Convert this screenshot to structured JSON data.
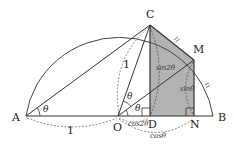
{
  "diagram": {
    "type": "semicircle-trig-geometry",
    "colors": {
      "stroke": "#333333",
      "shade": "#b0b0b0",
      "background": "#ffffff"
    },
    "points": {
      "A": {
        "label": "A",
        "x": 26,
        "y": 116
      },
      "O": {
        "label": "O",
        "x": 118,
        "y": 116
      },
      "B": {
        "label": "B",
        "x": 215,
        "y": 116
      },
      "C": {
        "label": "C",
        "x": 150,
        "y": 25
      },
      "M": {
        "label": "M",
        "x": 194,
        "y": 60
      },
      "D": {
        "label": "D",
        "x": 150,
        "y": 116
      },
      "N": {
        "label": "N",
        "x": 194,
        "y": 116
      }
    },
    "labels": {
      "A": "A",
      "O": "O",
      "B": "B",
      "C": "C",
      "M": "M",
      "D": "D",
      "N": "N",
      "angle_A": "θ",
      "angle_O_upper": "θ",
      "angle_O_lower": "θ",
      "length_AO": "1",
      "length_OC": "1",
      "sin2theta": "sin2θ",
      "sintheta": "sinθ",
      "cos2theta": "cos2θ",
      "costheta": "cosθ"
    },
    "shaded_region": "trapezoid CMND",
    "tick_marks": "CM = MB (equal arcs/chords marked)",
    "right_angles": [
      "D",
      "N"
    ]
  }
}
